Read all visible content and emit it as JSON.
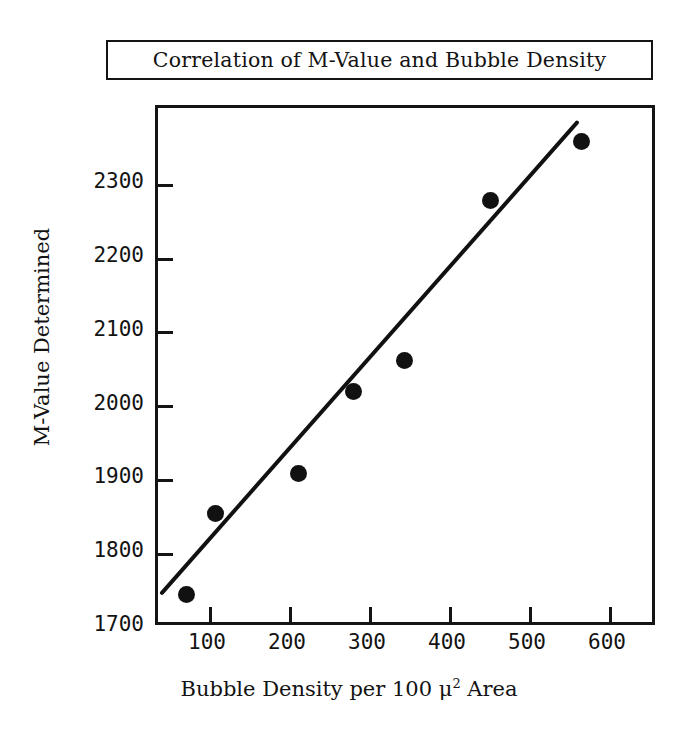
{
  "chart_data": {
    "type": "scatter",
    "title": "Correlation of M-Value and Bubble Density",
    "xlabel_prefix": "Bubble Density per 100 ",
    "xlabel_mu": "μ",
    "xlabel_sup": "2",
    "xlabel_suffix": " Area",
    "xlabel_plain": "Bubble Density per 100 μ2 Area",
    "ylabel": "M-Value Determined",
    "xlim": [
      35,
      660
    ],
    "ylim": [
      1700,
      2405
    ],
    "xticks": [
      100,
      200,
      300,
      400,
      500,
      600
    ],
    "xtick_labels": [
      "100",
      "200",
      "300",
      "400",
      "500",
      "600"
    ],
    "yticks": [
      1800,
      1900,
      2000,
      2100,
      2200,
      2300
    ],
    "ytick_labels": [
      "1700",
      "1800",
      "1900",
      "2000",
      "2100",
      "2200",
      "2300"
    ],
    "ytick_label_values": [
      1700,
      1800,
      1900,
      2000,
      2100,
      2200,
      2300
    ],
    "grid": false,
    "legend": "none",
    "marker": "filled-circle",
    "marker_color": "#111111",
    "line_color": "#111111",
    "frame_color": "#141414",
    "background": "#ffffff",
    "x": [
      70,
      107,
      211,
      279,
      343,
      450,
      564
    ],
    "y": [
      1745,
      1855,
      1910,
      2020,
      2062,
      2280,
      2360
    ],
    "points": [
      {
        "x": 70,
        "y": 1745
      },
      {
        "x": 107,
        "y": 1855
      },
      {
        "x": 211,
        "y": 1910
      },
      {
        "x": 279,
        "y": 2020
      },
      {
        "x": 343,
        "y": 2062
      },
      {
        "x": 450,
        "y": 2280
      },
      {
        "x": 564,
        "y": 2360
      }
    ],
    "trendline": {
      "type": "linear-fit",
      "x_start": 40,
      "y_start": 1740,
      "x_end": 565,
      "y_end": 2385
    }
  }
}
